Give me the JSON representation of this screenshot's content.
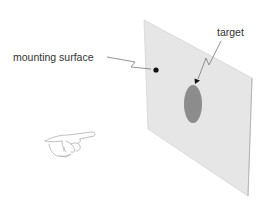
{
  "diagram": {
    "labels": {
      "mounting_surface": "mounting surface",
      "target": "target"
    },
    "colors": {
      "background": "#ffffff",
      "surface_fill": "#e6e6e6",
      "surface_edge": "#cfcfcf",
      "surface_right_edge": "#b5b5b5",
      "target_fill": "#8c8c8c",
      "leader_line": "#777777",
      "marker": "#111111",
      "hand_stroke": "#b0b0b0",
      "text": "#333333"
    },
    "elements": [
      {
        "id": "mounting-surface",
        "shape": "parallelogram",
        "corners": [
          [
            144,
            20
          ],
          [
            252,
            78
          ],
          [
            248,
            196
          ],
          [
            148,
            129
          ]
        ]
      },
      {
        "id": "target",
        "shape": "ellipse",
        "center": [
          193,
          104
        ],
        "rx": 9,
        "ry": 19
      },
      {
        "id": "surface-marker",
        "shape": "dot",
        "center": [
          156,
          70
        ]
      },
      {
        "id": "pointing-hand",
        "shape": "illustration",
        "bbox": [
          44,
          131,
          96,
          158
        ]
      }
    ]
  }
}
